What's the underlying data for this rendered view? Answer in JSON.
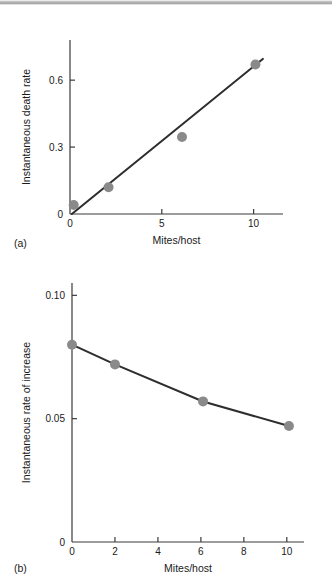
{
  "figure": {
    "panel_a_tag": "(a)",
    "panel_b_tag": "(b)"
  },
  "chart_data": [
    {
      "type": "scatter",
      "panel": "(a)",
      "title": "",
      "xlabel": "Mites/host",
      "ylabel": "Instantaneous death rate",
      "xlim": [
        0,
        11.6
      ],
      "ylim": [
        0,
        0.78
      ],
      "xticks": [
        0,
        5,
        10
      ],
      "xticklabels": [
        "0",
        "5",
        "10"
      ],
      "yticks": [
        0,
        0.3,
        0.6
      ],
      "yticklabels": [
        "0",
        "0.3",
        "0.6"
      ],
      "grid": false,
      "legend": "none",
      "x": [
        0.2,
        2.1,
        6.1,
        10.1
      ],
      "y": [
        0.04,
        0.12,
        0.345,
        0.67
      ],
      "fit_line": {
        "x": [
          0.1,
          10.5
        ],
        "y": [
          0.0,
          0.695
        ],
        "label": "regression line"
      }
    },
    {
      "type": "line",
      "panel": "(b)",
      "title": "",
      "xlabel": "Mites/host",
      "ylabel": "Instantaneous rate of increase",
      "xlim": [
        0,
        10.8
      ],
      "ylim": [
        0,
        0.105
      ],
      "xticks": [
        0,
        2,
        4,
        6,
        8,
        10
      ],
      "xticklabels": [
        "0",
        "2",
        "4",
        "6",
        "8",
        "10"
      ],
      "yticks": [
        0,
        0.05,
        0.1
      ],
      "yticklabels": [
        "0",
        "0.05",
        "0.10"
      ],
      "grid": false,
      "legend": "none",
      "x": [
        0.0,
        2.0,
        6.1,
        10.1
      ],
      "y": [
        0.08,
        0.072,
        0.057,
        0.047
      ],
      "markers": true
    }
  ]
}
